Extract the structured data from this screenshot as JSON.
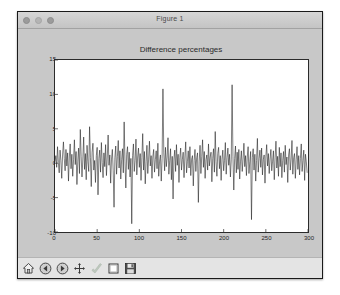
{
  "window": {
    "title": "Figure 1",
    "traffic_lights": [
      {
        "name": "close-button",
        "color": "#9b9b9b"
      },
      {
        "name": "minimize-button",
        "color": "#b4b4b4"
      },
      {
        "name": "zoom-button",
        "color": "#9b9b9b"
      }
    ]
  },
  "toolbar": {
    "buttons": [
      {
        "name": "home-icon",
        "label": "Home"
      },
      {
        "name": "back-arrow-icon",
        "label": "Back"
      },
      {
        "name": "forward-arrow-icon",
        "label": "Forward"
      },
      {
        "name": "pan-move-icon",
        "label": "Pan"
      },
      {
        "name": "zoom-rect-icon",
        "label": "Zoom to rectangle"
      },
      {
        "name": "configure-subplots-icon",
        "label": "Configure subplots"
      },
      {
        "name": "save-floppy-icon",
        "label": "Save figure"
      }
    ]
  },
  "chart_data": {
    "type": "line",
    "title": "Difference percentages",
    "xlabel": "",
    "ylabel": "",
    "xlim": [
      0,
      300
    ],
    "ylim": [
      -10,
      15
    ],
    "xticks": [
      0,
      50,
      100,
      150,
      200,
      250,
      300
    ],
    "yticks": [
      -10,
      -5,
      0,
      5,
      10,
      15
    ],
    "grid": false,
    "legend": null,
    "line_color": "#1a1a1a",
    "line_width": 0.6,
    "series": [
      {
        "name": "difference percentage",
        "x_start": 0,
        "x_step": 1,
        "values": [
          0.2,
          1.1,
          -0.6,
          2.4,
          0.1,
          -1.4,
          1.9,
          0.4,
          -2.2,
          1.2,
          3.1,
          0.7,
          -1.1,
          2.0,
          -0.4,
          1.5,
          -2.6,
          0.9,
          2.8,
          -0.8,
          1.3,
          -1.9,
          0.5,
          3.4,
          -0.2,
          1.7,
          -3.1,
          0.3,
          2.2,
          -1.5,
          4.9,
          1.0,
          -2.0,
          0.6,
          3.8,
          -0.9,
          1.4,
          -2.4,
          2.6,
          0.2,
          -1.2,
          5.3,
          0.8,
          -3.4,
          1.6,
          2.9,
          -1.0,
          0.4,
          -2.8,
          1.1,
          2.3,
          -4.6,
          0.7,
          1.9,
          -1.3,
          3.0,
          0.1,
          -2.1,
          1.5,
          -0.5,
          2.7,
          -1.8,
          0.9,
          4.1,
          -0.3,
          1.2,
          -2.9,
          0.6,
          2.0,
          -1.1,
          -6.4,
          0.8,
          2.5,
          -1.6,
          1.0,
          3.3,
          -0.7,
          1.8,
          -2.3,
          0.5,
          2.1,
          -1.4,
          6.0,
          0.3,
          -3.6,
          1.3,
          2.4,
          -0.9,
          1.6,
          -2.0,
          0.7,
          -8.8,
          1.1,
          2.8,
          -1.2,
          0.4,
          3.5,
          -1.7,
          0.9,
          2.2,
          -0.6,
          1.4,
          -2.5,
          0.8,
          4.3,
          -1.0,
          1.7,
          -3.0,
          0.2,
          2.6,
          -1.5,
          0.6,
          3.2,
          -0.4,
          1.1,
          -2.2,
          0.9,
          2.0,
          -1.3,
          0.5,
          1.8,
          -0.8,
          2.9,
          -1.9,
          0.3,
          1.2,
          -2.6,
          0.7,
          10.8,
          1.5,
          -1.1,
          2.3,
          -0.5,
          0.9,
          3.7,
          -1.6,
          0.4,
          2.1,
          -2.4,
          1.0,
          -5.2,
          0.6,
          1.9,
          -1.2,
          2.7,
          -0.3,
          1.3,
          -2.8,
          0.8,
          2.2,
          -1.0,
          0.5,
          1.6,
          -2.1,
          0.9,
          3.1,
          -1.4,
          0.2,
          1.8,
          -0.7,
          2.4,
          -1.8,
          0.6,
          1.1,
          -3.3,
          0.4,
          2.0,
          -1.2,
          0.8,
          1.5,
          -5.7,
          0.3,
          2.6,
          -1.5,
          1.0,
          3.4,
          -0.6,
          1.7,
          -2.2,
          0.5,
          1.2,
          -1.0,
          2.8,
          -0.4,
          0.9,
          1.6,
          -2.7,
          0.7,
          2.1,
          -1.3,
          4.6,
          0.2,
          -1.9,
          1.4,
          2.3,
          -0.8,
          1.1,
          -2.5,
          0.6,
          1.9,
          -1.1,
          0.4,
          3.0,
          -1.6,
          0.8,
          2.2,
          -0.3,
          1.3,
          -2.0,
          0.5,
          11.4,
          1.0,
          -3.9,
          0.7,
          2.5,
          -1.4,
          1.6,
          -0.9,
          2.0,
          -2.3,
          0.3,
          1.8,
          -1.2,
          0.6,
          2.9,
          -0.5,
          1.1,
          -1.8,
          0.9,
          2.4,
          -1.5,
          0.2,
          1.7,
          -8.2,
          0.8,
          2.1,
          -1.0,
          1.3,
          -2.6,
          0.4,
          3.6,
          -1.3,
          0.7,
          1.9,
          -0.6,
          2.2,
          -1.7,
          0.5,
          1.2,
          -2.9,
          0.9,
          2.7,
          -0.4,
          1.4,
          -1.5,
          0.6,
          2.0,
          -1.1,
          0.3,
          1.8,
          -2.4,
          0.8,
          3.2,
          -0.7,
          1.0,
          -1.9,
          2.3,
          -0.5,
          1.5,
          -2.1,
          0.4,
          1.7,
          -1.3,
          2.6,
          -0.2,
          0.9,
          -2.8,
          1.2,
          2.1,
          -1.0,
          0.6,
          3.3,
          -1.6,
          0.8,
          1.4,
          -2.2,
          0.5,
          2.4,
          -0.9,
          1.1,
          -1.7,
          0.7,
          2.8,
          -1.2,
          0.4,
          1.9,
          -2.5,
          1.3,
          0.2,
          -1.4
        ]
      }
    ]
  }
}
